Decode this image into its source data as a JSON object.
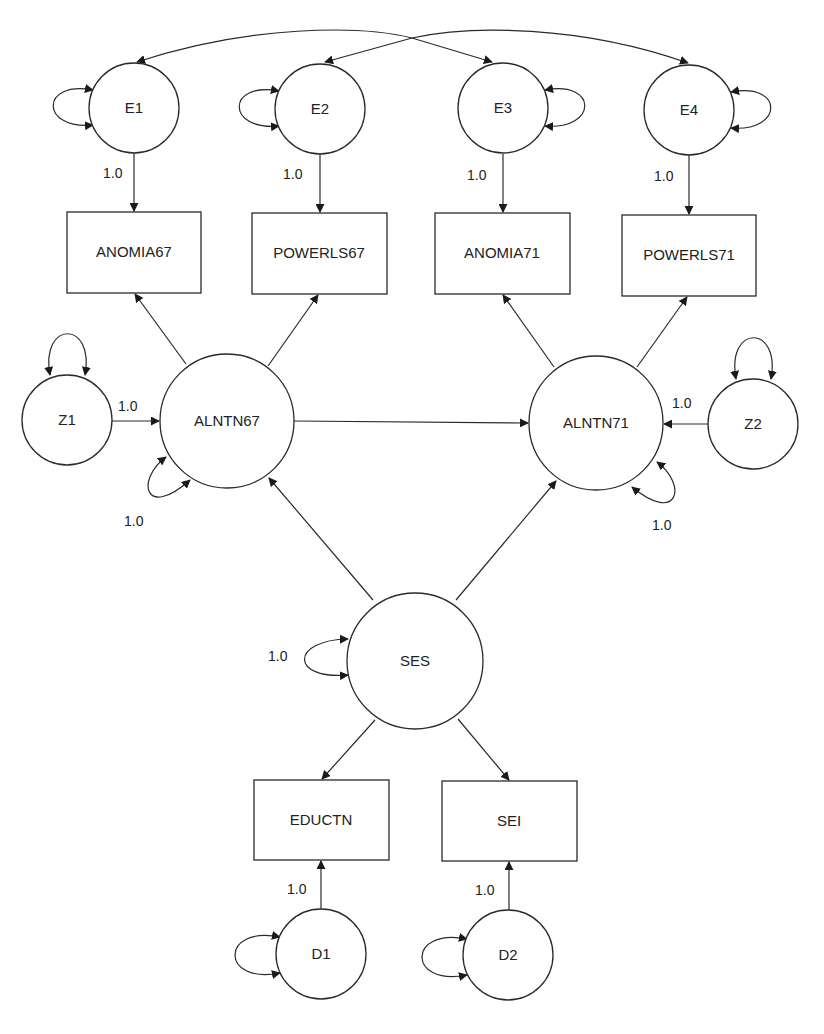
{
  "diagram": {
    "type": "structural-equation-model path diagram",
    "error_terms": [
      {
        "id": "E1",
        "label": "E1"
      },
      {
        "id": "E2",
        "label": "E2"
      },
      {
        "id": "E3",
        "label": "E3"
      },
      {
        "id": "E4",
        "label": "E4"
      }
    ],
    "observed": [
      {
        "id": "ANOMIA67",
        "label": "ANOMIA67"
      },
      {
        "id": "POWERLS67",
        "label": "POWERLS67"
      },
      {
        "id": "ANOMIA71",
        "label": "ANOMIA71"
      },
      {
        "id": "POWERLS71",
        "label": "POWERLS71"
      },
      {
        "id": "EDUCTN",
        "label": "EDUCTN"
      },
      {
        "id": "SEI",
        "label": "SEI"
      }
    ],
    "latent": [
      {
        "id": "ALNTN67",
        "label": "ALNTN67"
      },
      {
        "id": "ALNTN71",
        "label": "ALNTN71"
      },
      {
        "id": "SES",
        "label": "SES"
      }
    ],
    "disturbances": [
      {
        "id": "Z1",
        "label": "Z1"
      },
      {
        "id": "Z2",
        "label": "Z2"
      },
      {
        "id": "D1",
        "label": "D1"
      },
      {
        "id": "D2",
        "label": "D2"
      }
    ],
    "coefficients": {
      "e1_anomia67": "1.0",
      "e2_powerls67": "1.0",
      "e3_anomia71": "1.0",
      "e4_powerls71": "1.0",
      "z1_alntn67": "1.0",
      "alntn67_variance": "1.0",
      "z2_alntn71": "1.0",
      "alntn71_variance": "1.0",
      "ses_variance": "1.0",
      "d1_eductn": "1.0",
      "d2_sei": "1.0"
    },
    "paths": [
      {
        "from": "E1",
        "to": "ANOMIA67",
        "label": "1.0"
      },
      {
        "from": "E2",
        "to": "POWERLS67",
        "label": "1.0"
      },
      {
        "from": "E3",
        "to": "ANOMIA71",
        "label": "1.0"
      },
      {
        "from": "E4",
        "to": "POWERLS71",
        "label": "1.0"
      },
      {
        "from": "ALNTN67",
        "to": "ANOMIA67"
      },
      {
        "from": "ALNTN67",
        "to": "POWERLS67"
      },
      {
        "from": "ALNTN71",
        "to": "ANOMIA71"
      },
      {
        "from": "ALNTN71",
        "to": "POWERLS71"
      },
      {
        "from": "Z1",
        "to": "ALNTN67",
        "label": "1.0"
      },
      {
        "from": "Z2",
        "to": "ALNTN71",
        "label": "1.0"
      },
      {
        "from": "ALNTN67",
        "to": "ALNTN71"
      },
      {
        "from": "SES",
        "to": "ALNTN67"
      },
      {
        "from": "SES",
        "to": "ALNTN71"
      },
      {
        "from": "SES",
        "to": "EDUCTN"
      },
      {
        "from": "SES",
        "to": "SEI"
      },
      {
        "from": "D1",
        "to": "EDUCTN",
        "label": "1.0"
      },
      {
        "from": "D2",
        "to": "SEI",
        "label": "1.0"
      }
    ],
    "covariances": [
      {
        "between": [
          "E1",
          "E3"
        ]
      },
      {
        "between": [
          "E2",
          "E4"
        ]
      }
    ]
  }
}
